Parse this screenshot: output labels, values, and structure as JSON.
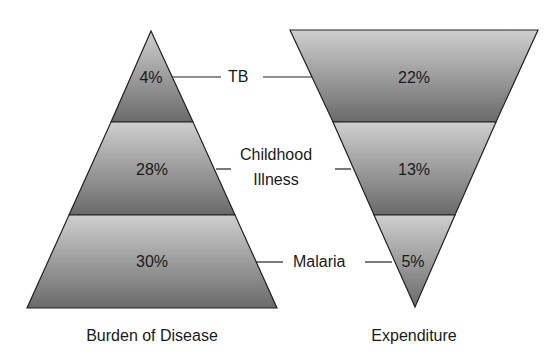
{
  "diagram": {
    "left": {
      "caption": "Burden of Disease",
      "shape": "triangle",
      "segments": [
        {
          "name": "TB",
          "value": "4%"
        },
        {
          "name": "Childhood Illness",
          "value": "28%"
        },
        {
          "name": "Malaria",
          "value": "30%"
        }
      ]
    },
    "right": {
      "caption": "Expenditure",
      "shape": "inverted-triangle",
      "segments": [
        {
          "name": "TB",
          "value": "22%"
        },
        {
          "name": "Childhood Illness",
          "value": "13%"
        },
        {
          "name": "Malaria",
          "value": "5%"
        }
      ]
    },
    "labels": {
      "tb": "TB",
      "childhood_line1": "Childhood",
      "childhood_line2": "Illness",
      "malaria": "Malaria"
    },
    "colors": {
      "segment_light": "#c4c4c4",
      "segment_dark": "#6e6e6e",
      "outline": "#222222",
      "text": "#1a1a1a"
    }
  }
}
